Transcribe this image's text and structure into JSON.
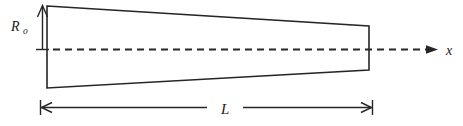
{
  "figure": {
    "labels": {
      "radius_main": "R",
      "radius_sub": "o",
      "length": "L",
      "axis": "x"
    },
    "colors": {
      "line": "#262626",
      "background": "#ffffff"
    }
  }
}
